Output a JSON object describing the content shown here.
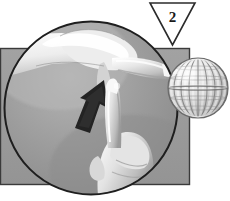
{
  "figure": {
    "name": "instructional-step-illustration",
    "step_badge": {
      "label": "2",
      "shape": "downward-triangle",
      "fill": "#ffffff",
      "stroke": "#2b2b2b"
    },
    "background_color": "#ffffff",
    "panel": {
      "name": "gray-backdrop-panel",
      "fill": "#9a9a9a",
      "stroke": "#3a3a3a",
      "x": 0,
      "y": 48,
      "width": 190,
      "height": 137
    },
    "magnifier": {
      "name": "circular-closeup-inset",
      "fill": "#9c9c9c",
      "stroke": "#1e1e1e",
      "center_x": 91,
      "center_y": 108,
      "radius": 87
    },
    "ball": {
      "name": "striped-sphere",
      "center_x": 198,
      "center_y": 88,
      "radius": 30,
      "highlight_color": "#f2f2f2",
      "shadow_color": "#7e7e7e",
      "stripe_count": 9
    },
    "arrow": {
      "name": "motion-arrow",
      "fill": "#232323",
      "direction": "up-right",
      "description": "flick motion arrow"
    },
    "hands": {
      "upper": {
        "name": "upper-hand-thumb-and-finger",
        "skin_light": "#f4f4f4",
        "skin_mid": "#cfcfcf",
        "skin_shadow": "#a8a8a8"
      },
      "lower": {
        "name": "lower-hand-pointing-finger",
        "skin_light": "#efefef",
        "skin_mid": "#c9c9c9",
        "skin_shadow": "#9e9e9e"
      }
    }
  }
}
